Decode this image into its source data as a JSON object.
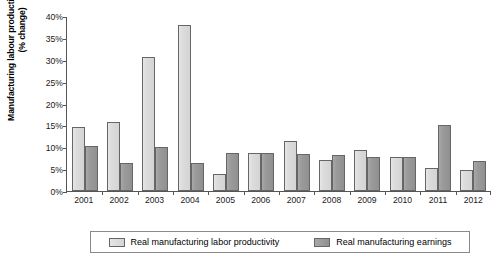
{
  "chart_data": {
    "type": "bar",
    "title": "",
    "xlabel": "",
    "ylabel": "Manufacturing labour productivity & earnings (% change)",
    "ylim": [
      0,
      40
    ],
    "ytick_labels": [
      "0%",
      "5%",
      "10%",
      "15%",
      "20%",
      "25%",
      "30%",
      "35%",
      "40%"
    ],
    "ytick_values": [
      0,
      5,
      10,
      15,
      20,
      25,
      30,
      35,
      40
    ],
    "grid": false,
    "legend_position": "bottom",
    "categories": [
      "2001",
      "2002",
      "2003",
      "2004",
      "2005",
      "2006",
      "2007",
      "2008",
      "2009",
      "2010",
      "2011",
      "2012"
    ],
    "series": [
      {
        "name": "Real manufacturing labor productivity",
        "color": "#d9d9d9",
        "values": [
          14.6,
          15.8,
          30.6,
          38.0,
          3.8,
          8.7,
          11.5,
          7.0,
          9.4,
          7.7,
          5.2,
          4.8
        ]
      },
      {
        "name": "Real manufacturing earnings",
        "color": "#969696",
        "values": [
          10.3,
          6.3,
          10.0,
          6.5,
          8.8,
          8.7,
          8.4,
          8.2,
          7.8,
          7.7,
          15.0,
          6.8
        ]
      }
    ]
  },
  "legend": {
    "entries": [
      {
        "label": "Real manufacturing labor productivity",
        "swatch": "light-gray-square"
      },
      {
        "label": "Real manufacturing earnings",
        "swatch": "dark-gray-square"
      }
    ]
  }
}
